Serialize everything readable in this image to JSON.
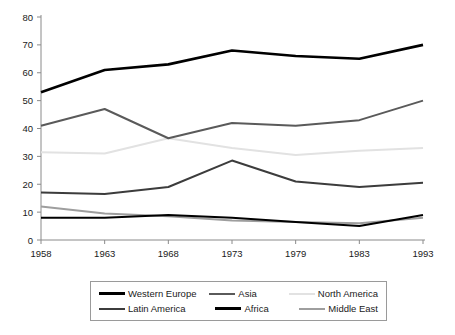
{
  "chart_data": {
    "type": "line",
    "title": "",
    "subtitle": "",
    "xlabel": "",
    "ylabel": "",
    "x": [
      1958,
      1963,
      1968,
      1973,
      1979,
      1983,
      1993
    ],
    "categories": [
      "1958",
      "1963",
      "1968",
      "1973",
      "1979",
      "1983",
      "1993"
    ],
    "xtick_labels": [
      "1958",
      "1963",
      "1968",
      "1973",
      "1979",
      "1983",
      "1993"
    ],
    "ytick_labels": [
      "0",
      "10",
      "20",
      "30",
      "40",
      "50",
      "60",
      "70",
      "80"
    ],
    "yticks": [
      0,
      10,
      20,
      30,
      40,
      50,
      60,
      70,
      80
    ],
    "ylim": [
      0,
      80
    ],
    "grid": false,
    "legend_position": "bottom",
    "series": [
      {
        "name": "Western Europe",
        "color": "#000000",
        "width": 2.6,
        "values": [
          53,
          61,
          63,
          68,
          66,
          65,
          70
        ]
      },
      {
        "name": "Asia",
        "color": "#5a5a5a",
        "width": 2.0,
        "values": [
          41,
          47,
          36.5,
          42,
          41,
          43,
          50
        ]
      },
      {
        "name": "North America",
        "color": "#e2e2e2",
        "width": 2.0,
        "values": [
          31.5,
          31,
          36.5,
          33,
          30.5,
          32,
          33
        ]
      },
      {
        "name": "Latin America",
        "color": "#3c3c3c",
        "width": 2.0,
        "values": [
          17,
          16.5,
          19,
          28.5,
          21,
          19,
          20.5
        ]
      },
      {
        "name": "Africa",
        "color": "#000000",
        "width": 2.0,
        "values": [
          8,
          8,
          9,
          8,
          6.5,
          5,
          9
        ]
      },
      {
        "name": "Middle East",
        "color": "#9e9e9e",
        "width": 2.0,
        "values": [
          12,
          9.5,
          8.5,
          7,
          6.5,
          6,
          8
        ]
      }
    ]
  },
  "legend": {
    "rows": [
      [
        {
          "label": "Western Europe",
          "color": "#000000",
          "width": 3.2
        },
        {
          "label": "Asia",
          "color": "#5a5a5a",
          "width": 2.6
        },
        {
          "label": "North America",
          "color": "#e2e2e2",
          "width": 2.6
        }
      ],
      [
        {
          "label": "Latin America",
          "color": "#3c3c3c",
          "width": 2.6
        },
        {
          "label": "Africa",
          "color": "#000000",
          "width": 3.2
        },
        {
          "label": "Middle East",
          "color": "#9e9e9e",
          "width": 2.6
        }
      ]
    ]
  },
  "axes": {
    "axis_color": "#8a8a8a",
    "tick_color": "#8a8a8a",
    "label_color": "#1a1a1a"
  }
}
